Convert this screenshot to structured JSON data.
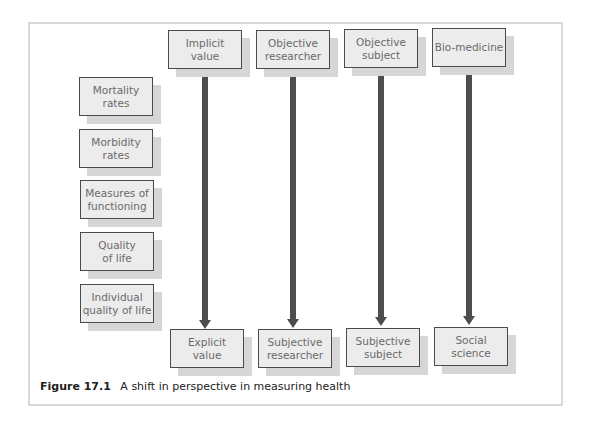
{
  "diagram": {
    "top_row": [
      {
        "label": "Implicit\nvalue",
        "x": 168
      },
      {
        "label": "Objective\nresearcher",
        "x": 256
      },
      {
        "label": "Objective\nsubject",
        "x": 344
      },
      {
        "label": "Bio-medicine",
        "x": 432
      }
    ],
    "bottom_row": [
      {
        "label": "Explicit\nvalue"
      },
      {
        "label": "Subjective\nresearcher"
      },
      {
        "label": "Subjective\nsubject"
      },
      {
        "label": "Social\nscience"
      }
    ],
    "left_column": [
      {
        "label": "Mortality\nrates"
      },
      {
        "label": "Morbidity\nrates"
      },
      {
        "label": "Measures of\nfunctioning"
      },
      {
        "label": "Quality\nof life"
      },
      {
        "label": "Individual\nquality of life"
      }
    ],
    "colors": {
      "box_fill": "#ececec",
      "box_border": "#4a4a4a",
      "shadow": "#d6d6d6",
      "arrow": "#4d4d4d",
      "frame": "#d8d8d8"
    }
  },
  "caption": {
    "figure_number": "Figure 17.1",
    "text": "A shift in perspective in measuring health"
  }
}
